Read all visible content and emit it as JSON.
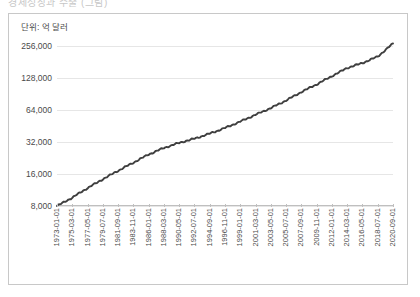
{
  "window": {
    "clipped_title": "경제성장과 수출 (그림)"
  },
  "chart_data": {
    "type": "line",
    "title": "",
    "unit_label": "단위: 억 달러",
    "xlabel": "",
    "ylabel": "",
    "yscale": "log2",
    "ylim": [
      8000,
      300000
    ],
    "yticks": [
      8000,
      16000,
      32000,
      64000,
      128000,
      256000
    ],
    "ytick_labels": [
      "8,000",
      "16,000",
      "32,000",
      "64,000",
      "128,000",
      "256,000"
    ],
    "grid": true,
    "legend": "none",
    "line_color": "#3f3f3f",
    "categories": [
      "1973-01-01",
      "1975-03-01",
      "1977-05-01",
      "1979-07-01",
      "1981-09-01",
      "1983-11-01",
      "1986-01-01",
      "1988-03-01",
      "1990-05-01",
      "1992-07-01",
      "1994-09-01",
      "1996-11-01",
      "1999-01-01",
      "2001-03-01",
      "2003-05-01",
      "2005-07-01",
      "2007-09-01",
      "2009-11-01",
      "2012-01-01",
      "2014-03-01",
      "2016-05-01",
      "2018-07-01",
      "2020-09-01"
    ],
    "x": [
      1973.0,
      1975.17,
      1977.33,
      1979.5,
      1981.67,
      1983.83,
      1986.0,
      1988.17,
      1990.33,
      1992.5,
      1994.67,
      1996.83,
      1999.0,
      2001.17,
      2003.33,
      2005.5,
      2007.67,
      2009.83,
      2012.0,
      2014.17,
      2016.33,
      2018.5,
      2020.67
    ],
    "values": [
      8000,
      9600,
      11800,
      14300,
      17200,
      20500,
      24500,
      28200,
      31500,
      34500,
      38500,
      43500,
      50000,
      58000,
      67000,
      79000,
      95000,
      112000,
      134000,
      160000,
      178000,
      205000,
      272000
    ],
    "series": [
      {
        "name": "",
        "values": [
          8000,
          9600,
          11800,
          14300,
          17200,
          20500,
          24500,
          28200,
          31500,
          34500,
          38500,
          43500,
          50000,
          58000,
          67000,
          79000,
          95000,
          112000,
          134000,
          160000,
          178000,
          205000,
          272000
        ]
      }
    ],
    "annotations": [
      "steep rise 1973-1985",
      "flattening around 1988-1996",
      "steady climb 1999-2015",
      "sharp spike at 2020"
    ]
  }
}
